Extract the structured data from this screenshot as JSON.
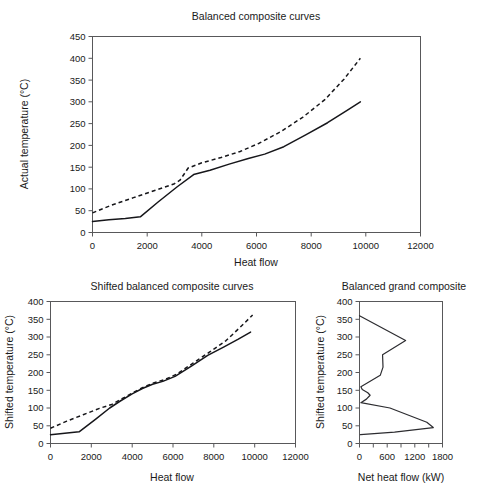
{
  "figure": {
    "name": "balanced-composite-curves-figure",
    "background": "#ffffff",
    "line_color": "#16161a",
    "axis_color": "#58585a"
  },
  "chart_data": [
    {
      "id": "balanced-composite",
      "type": "line",
      "title": "Balanced composite curves",
      "xlabel": "Heat flow",
      "ylabel": "Actual temperature (°C)",
      "xlim": [
        0,
        12000
      ],
      "ylim": [
        0,
        450
      ],
      "xticks": [
        0,
        2000,
        4000,
        6000,
        8000,
        10000,
        12000
      ],
      "yticks": [
        0,
        50,
        100,
        150,
        200,
        250,
        300,
        350,
        400,
        450
      ],
      "grid": false,
      "legend": "none",
      "series": [
        {
          "name": "Cold composite curve",
          "style": "solid",
          "points": [
            [
              0,
              25
            ],
            [
              600,
              29
            ],
            [
              1200,
              32
            ],
            [
              1750,
              36
            ],
            [
              2400,
              70
            ],
            [
              3100,
              105
            ],
            [
              3700,
              133
            ],
            [
              4300,
              143
            ],
            [
              5000,
              157
            ],
            [
              5700,
              170
            ],
            [
              6300,
              180
            ],
            [
              7000,
              197
            ],
            [
              7800,
              224
            ],
            [
              8600,
              252
            ],
            [
              9300,
              280
            ],
            [
              9800,
              300
            ]
          ]
        },
        {
          "name": "Hot composite curve",
          "style": "dashed",
          "points": [
            [
              0,
              45
            ],
            [
              700,
              63
            ],
            [
              1500,
              80
            ],
            [
              2300,
              97
            ],
            [
              3000,
              112
            ],
            [
              3200,
              120
            ],
            [
              3500,
              148
            ],
            [
              4000,
              160
            ],
            [
              4700,
              172
            ],
            [
              5400,
              186
            ],
            [
              6100,
              205
            ],
            [
              6900,
              232
            ],
            [
              7700,
              265
            ],
            [
              8500,
              305
            ],
            [
              9200,
              352
            ],
            [
              9800,
              400
            ]
          ]
        }
      ]
    },
    {
      "id": "shifted-balanced-composite",
      "type": "line",
      "title": "Shifted balanced composite curves",
      "xlabel": "Heat flow",
      "ylabel": "Shifted temperature (°C)",
      "xlim": [
        0,
        12000
      ],
      "ylim": [
        0,
        400
      ],
      "xticks": [
        0,
        2000,
        4000,
        6000,
        8000,
        10000,
        12000
      ],
      "yticks": [
        0,
        50,
        100,
        150,
        200,
        250,
        300,
        350,
        400
      ],
      "grid": false,
      "legend": "none",
      "series": [
        {
          "name": "Cold shifted composite curve",
          "style": "solid",
          "points": [
            [
              0,
              25
            ],
            [
              700,
              29
            ],
            [
              1400,
              33
            ],
            [
              2200,
              68
            ],
            [
              2900,
              100
            ],
            [
              3400,
              119
            ],
            [
              4000,
              140
            ],
            [
              4500,
              155
            ],
            [
              5000,
              167
            ],
            [
              5500,
              175
            ],
            [
              6100,
              189
            ],
            [
              6900,
              218
            ],
            [
              7700,
              248
            ],
            [
              8500,
              272
            ],
            [
              9200,
              294
            ],
            [
              9800,
              314
            ]
          ]
        },
        {
          "name": "Hot shifted composite curve",
          "style": "dashed",
          "points": [
            [
              0,
              43
            ],
            [
              800,
              63
            ],
            [
              1600,
              81
            ],
            [
              2400,
              99
            ],
            [
              3000,
              110
            ],
            [
              3500,
              126
            ],
            [
              4000,
              142
            ],
            [
              4500,
              157
            ],
            [
              5000,
              170
            ],
            [
              5600,
              180
            ],
            [
              6200,
              196
            ],
            [
              7000,
              227
            ],
            [
              7800,
              258
            ],
            [
              8600,
              290
            ],
            [
              9300,
              328
            ],
            [
              9900,
              362
            ]
          ]
        }
      ]
    },
    {
      "id": "balanced-grand-composite",
      "type": "line",
      "title": "Balanced grand composite",
      "xlabel": "Net heat flow (kW)",
      "ylabel": "Shifted temperature (°C)",
      "xlim": [
        0,
        1800
      ],
      "ylim": [
        0,
        400
      ],
      "xticks": [
        0,
        300,
        600,
        900,
        1200,
        1500,
        1800
      ],
      "xtick_labels": [
        "0",
        "",
        "600",
        "",
        "1200",
        "",
        "1800"
      ],
      "yticks": [
        0,
        50,
        100,
        150,
        200,
        250,
        300,
        350,
        400
      ],
      "grid": false,
      "legend": "none",
      "series": [
        {
          "name": "Grand composite curve",
          "style": "solid",
          "points": [
            [
              0,
              360
            ],
            [
              1000,
              290
            ],
            [
              500,
              250
            ],
            [
              510,
              215
            ],
            [
              450,
              192
            ],
            [
              30,
              160
            ],
            [
              60,
              152
            ],
            [
              180,
              143
            ],
            [
              230,
              136
            ],
            [
              150,
              125
            ],
            [
              30,
              115
            ],
            [
              660,
              100
            ],
            [
              1460,
              60
            ],
            [
              1600,
              45
            ],
            [
              760,
              32
            ],
            [
              20,
              25
            ]
          ]
        }
      ]
    }
  ]
}
